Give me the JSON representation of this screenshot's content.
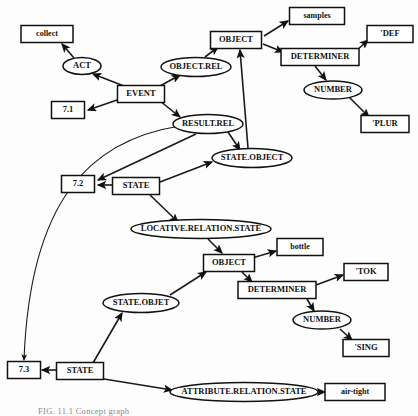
{
  "figure": {
    "caption": "FIG. 11.1    Concept graph",
    "width": 418,
    "height": 415,
    "background_color": "#fdfdfd",
    "stroke_color": "#111111"
  },
  "nodes": [
    {
      "id": "collect",
      "label": "collect",
      "shape": "box",
      "cx": 47,
      "cy": 34,
      "w": 52,
      "h": 17,
      "fs": 8
    },
    {
      "id": "act",
      "label": "ACT",
      "shape": "ellipse",
      "cx": 82,
      "cy": 66,
      "w": 38,
      "h": 17,
      "fs": 8.5
    },
    {
      "id": "event",
      "label": "EVENT",
      "shape": "box",
      "cx": 141,
      "cy": 94,
      "w": 47,
      "h": 17,
      "fs": 8.5
    },
    {
      "id": "n71",
      "label": "7.1",
      "shape": "box",
      "cx": 68,
      "cy": 110,
      "w": 33,
      "h": 17,
      "fs": 8.5
    },
    {
      "id": "object_rel",
      "label": "OBJECT.REL",
      "shape": "ellipse",
      "cx": 196,
      "cy": 67,
      "w": 70,
      "h": 19,
      "fs": 8.5
    },
    {
      "id": "object_top",
      "label": "OBJECT",
      "shape": "box",
      "cx": 236,
      "cy": 40,
      "w": 51,
      "h": 17,
      "fs": 8.5
    },
    {
      "id": "samples",
      "label": "samples",
      "shape": "box",
      "cx": 317,
      "cy": 16,
      "w": 55,
      "h": 17,
      "fs": 8
    },
    {
      "id": "determiner_top",
      "label": "DETERMINER",
      "shape": "box",
      "cx": 320,
      "cy": 57,
      "w": 78,
      "h": 17,
      "fs": 8.5
    },
    {
      "id": "def",
      "label": "'DEF",
      "shape": "box",
      "cx": 390,
      "cy": 34,
      "w": 46,
      "h": 17,
      "fs": 8.5
    },
    {
      "id": "number_top",
      "label": "NUMBER",
      "shape": "ellipse",
      "cx": 333,
      "cy": 90,
      "w": 58,
      "h": 18,
      "fs": 8.5
    },
    {
      "id": "plur",
      "label": "'PLUR",
      "shape": "box",
      "cx": 385,
      "cy": 124,
      "w": 48,
      "h": 17,
      "fs": 8.5
    },
    {
      "id": "result_rel",
      "label": "RESULT.REL",
      "shape": "ellipse",
      "cx": 208,
      "cy": 124,
      "w": 70,
      "h": 19,
      "fs": 8.5
    },
    {
      "id": "state_object_1",
      "label": "STATE.OBJECT",
      "shape": "ellipse",
      "cx": 252,
      "cy": 158,
      "w": 80,
      "h": 19,
      "fs": 8.5
    },
    {
      "id": "n72",
      "label": "7.2",
      "shape": "box",
      "cx": 78,
      "cy": 184,
      "w": 33,
      "h": 17,
      "fs": 8.5
    },
    {
      "id": "state_mid",
      "label": "STATE",
      "shape": "box",
      "cx": 136,
      "cy": 186,
      "w": 47,
      "h": 17,
      "fs": 8.5
    },
    {
      "id": "locative",
      "label": "LOCATIVE.RELATION.STATE",
      "shape": "ellipse",
      "cx": 201,
      "cy": 229,
      "w": 140,
      "h": 19,
      "fs": 8.5
    },
    {
      "id": "object_bot",
      "label": "OBJECT",
      "shape": "box",
      "cx": 229,
      "cy": 263,
      "w": 51,
      "h": 17,
      "fs": 8.5
    },
    {
      "id": "bottle",
      "label": "bottle",
      "shape": "box",
      "cx": 300,
      "cy": 247,
      "w": 46,
      "h": 17,
      "fs": 8
    },
    {
      "id": "determiner_bot",
      "label": "DETERMINER",
      "shape": "box",
      "cx": 277,
      "cy": 290,
      "w": 78,
      "h": 17,
      "fs": 8.5
    },
    {
      "id": "tok",
      "label": "'TOK",
      "shape": "box",
      "cx": 366,
      "cy": 272,
      "w": 44,
      "h": 17,
      "fs": 8.5
    },
    {
      "id": "number_bot",
      "label": "NUMBER",
      "shape": "ellipse",
      "cx": 322,
      "cy": 320,
      "w": 58,
      "h": 18,
      "fs": 8.5
    },
    {
      "id": "sing",
      "label": "'SING",
      "shape": "box",
      "cx": 366,
      "cy": 348,
      "w": 46,
      "h": 17,
      "fs": 8.5
    },
    {
      "id": "state_objet",
      "label": "STATE.OBJET",
      "shape": "ellipse",
      "cx": 141,
      "cy": 303,
      "w": 76,
      "h": 19,
      "fs": 8.5
    },
    {
      "id": "n73",
      "label": "7.3",
      "shape": "box",
      "cx": 24,
      "cy": 370,
      "w": 33,
      "h": 17,
      "fs": 8.5
    },
    {
      "id": "state_bot",
      "label": "STATE",
      "shape": "box",
      "cx": 80,
      "cy": 371,
      "w": 47,
      "h": 17,
      "fs": 8.5
    },
    {
      "id": "attribute",
      "label": "ATTRIBUTE.RELATION.STATE",
      "shape": "ellipse",
      "cx": 244,
      "cy": 392,
      "w": 148,
      "h": 19,
      "fs": 8.5
    },
    {
      "id": "airtight",
      "label": "air-tight",
      "shape": "box",
      "cx": 355,
      "cy": 392,
      "w": 60,
      "h": 17,
      "fs": 8
    }
  ],
  "edges": [
    {
      "from": "act",
      "to": "collect",
      "path": "M 74,58 L 62,44"
    },
    {
      "from": "event",
      "to": "act",
      "path": "M 124,86 L 93,74"
    },
    {
      "from": "event",
      "to": "n71",
      "path": "M 120,99 L 88,110"
    },
    {
      "from": "event",
      "to": "object_rel",
      "path": "M 160,86 L 180,75"
    },
    {
      "from": "event",
      "to": "result_rel",
      "path": "M 160,101 L 180,117"
    },
    {
      "from": "object_rel",
      "to": "object_top",
      "path": "M 205,57 L 218,47"
    },
    {
      "from": "object_top",
      "to": "samples",
      "path": "M 264,36 L 288,21"
    },
    {
      "from": "object_top",
      "to": "determiner_top",
      "path": "M 263,44 L 283,52"
    },
    {
      "from": "determiner_top",
      "to": "def",
      "path": "M 355,52 L 368,40"
    },
    {
      "from": "determiner_top",
      "to": "number_top",
      "path": "M 315,66 L 326,80"
    },
    {
      "from": "number_top",
      "to": "plur",
      "path": "M 349,97 L 369,117"
    },
    {
      "from": "state_object_1",
      "to": "object_top",
      "path": "M 248,148 L 240,50"
    },
    {
      "from": "result_rel",
      "to": "state_object_1",
      "path": "M 228,132 L 240,150"
    },
    {
      "from": "result_rel",
      "to": "n72",
      "path": "M 196,134 L 98,180"
    },
    {
      "from": "result_rel",
      "to": "n73",
      "path": "M 180,126 C 90,140 30,200 24,360",
      "curved": true
    },
    {
      "from": "state_mid",
      "to": "n72",
      "path": "M 112,185 L 98,185"
    },
    {
      "from": "state_mid",
      "to": "state_object_1",
      "path": "M 160,182 L 212,162"
    },
    {
      "from": "state_mid",
      "to": "locative",
      "path": "M 150,195 L 178,222"
    },
    {
      "from": "locative",
      "to": "object_bot",
      "path": "M 208,239 L 222,253"
    },
    {
      "from": "object_bot",
      "to": "bottle",
      "path": "M 252,258 L 276,251"
    },
    {
      "from": "object_bot",
      "to": "determiner_bot",
      "path": "M 242,272 L 252,282"
    },
    {
      "from": "determiner_bot",
      "to": "tok",
      "path": "M 316,285 L 343,275"
    },
    {
      "from": "determiner_bot",
      "to": "number_bot",
      "path": "M 307,299 L 314,311"
    },
    {
      "from": "number_bot",
      "to": "sing",
      "path": "M 340,329 L 352,340"
    },
    {
      "from": "state_objet",
      "to": "object_bot",
      "path": "M 170,295 L 206,272"
    },
    {
      "from": "state_bot",
      "to": "state_objet",
      "path": "M 93,363 L 122,313"
    },
    {
      "from": "state_bot",
      "to": "n73",
      "path": "M 56,370 L 42,370"
    },
    {
      "from": "state_bot",
      "to": "attribute",
      "path": "M 104,379 L 172,390"
    },
    {
      "from": "attribute",
      "to": "airtight",
      "path": "M 318,392 L 325,392"
    }
  ]
}
